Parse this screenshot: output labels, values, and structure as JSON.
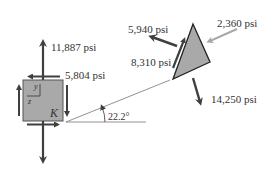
{
  "diagram": {
    "element_label": "K",
    "axes": {
      "y": "y",
      "z": "z"
    },
    "angle": "22.2°",
    "element_stresses": {
      "normal_y": "11,887 psi",
      "shear": "5,804 psi"
    },
    "wedge_stresses": {
      "top_right": "2,360 psi",
      "upper_left": "5,940 psi",
      "shear": "8,310 psi",
      "bottom": "14,250 psi"
    },
    "colors": {
      "element_fill": "#a9a9a9",
      "arrow_dark": "#3f3f3f",
      "arrow_gray": "#a8a8a8",
      "text": "#333333"
    }
  }
}
